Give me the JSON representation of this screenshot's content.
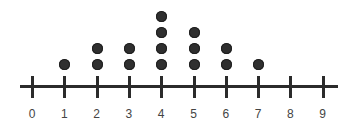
{
  "chart_data": {
    "type": "dot",
    "title": "",
    "xlabel": "",
    "ylabel": "",
    "categories": [
      "0",
      "1",
      "2",
      "3",
      "4",
      "5",
      "6",
      "7",
      "8",
      "9"
    ],
    "x": [
      0,
      1,
      2,
      3,
      4,
      5,
      6,
      7,
      8,
      9
    ],
    "values": [
      0,
      1,
      2,
      2,
      4,
      3,
      2,
      1,
      0,
      0
    ],
    "xlim": [
      0,
      9
    ],
    "grid": false,
    "legend": null,
    "colors": {
      "dot": "#2f2f2f",
      "axis": "#2b2b2b",
      "label": "#444444"
    }
  }
}
